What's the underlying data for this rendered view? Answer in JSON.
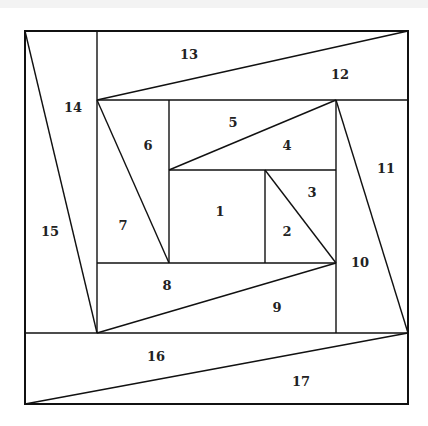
{
  "diagram": {
    "type": "log-cabin-spiral-piecing",
    "stroke_color": "#111111",
    "background": "#ffffff",
    "frame": {
      "x1": 25,
      "y1": 31,
      "x2": 408,
      "y2": 404
    },
    "labels": [
      {
        "id": "1",
        "text": "1",
        "x": 220,
        "y": 212
      },
      {
        "id": "2",
        "text": "2",
        "x": 287,
        "y": 232
      },
      {
        "id": "3",
        "text": "3",
        "x": 312,
        "y": 193
      },
      {
        "id": "4",
        "text": "4",
        "x": 287,
        "y": 146
      },
      {
        "id": "5",
        "text": "5",
        "x": 233,
        "y": 123
      },
      {
        "id": "6",
        "text": "6",
        "x": 148,
        "y": 146
      },
      {
        "id": "7",
        "text": "7",
        "x": 123,
        "y": 226
      },
      {
        "id": "8",
        "text": "8",
        "x": 167,
        "y": 286
      },
      {
        "id": "9",
        "text": "9",
        "x": 277,
        "y": 308
      },
      {
        "id": "10",
        "text": "10",
        "x": 360,
        "y": 263
      },
      {
        "id": "11",
        "text": "11",
        "x": 386,
        "y": 169
      },
      {
        "id": "12",
        "text": "12",
        "x": 340,
        "y": 75
      },
      {
        "id": "13",
        "text": "13",
        "x": 189,
        "y": 55
      },
      {
        "id": "14",
        "text": "14",
        "x": 73,
        "y": 108
      },
      {
        "id": "15",
        "text": "15",
        "x": 50,
        "y": 232
      },
      {
        "id": "16",
        "text": "16",
        "x": 156,
        "y": 357
      },
      {
        "id": "17",
        "text": "17",
        "x": 301,
        "y": 382
      }
    ]
  }
}
